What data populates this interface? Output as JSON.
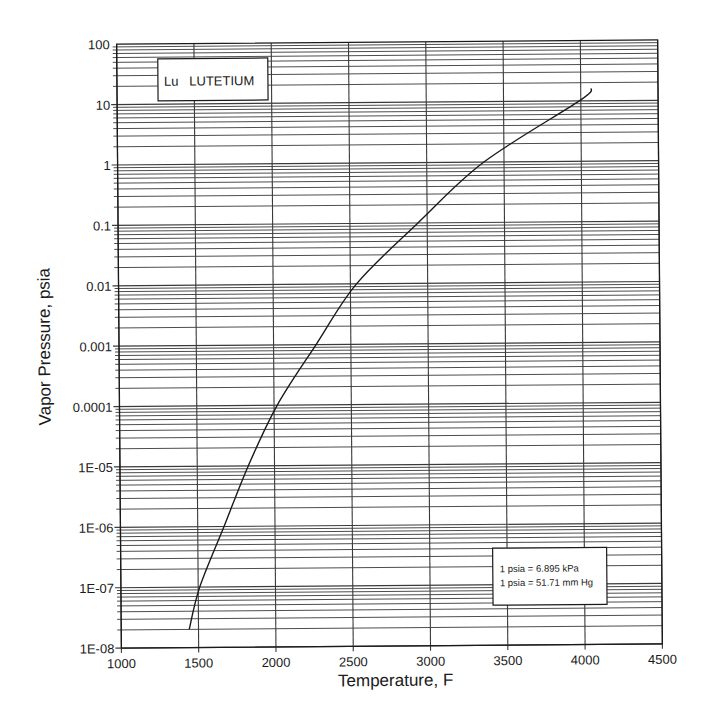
{
  "chart_data": {
    "type": "line",
    "title": "Lu LUTETIUM",
    "xlabel": "Temperature, F",
    "ylabel": "Vapor Pressure, psia",
    "xlim": [
      1000,
      4500
    ],
    "ylim": [
      1e-08,
      100
    ],
    "yscale": "log",
    "grid": true,
    "x_ticks": [
      1000,
      1500,
      2000,
      2500,
      3000,
      3500,
      4000,
      4500
    ],
    "x_tick_labels": [
      "1000",
      "1500",
      "2000",
      "2500",
      "3000",
      "3500",
      "4000",
      "4500"
    ],
    "y_ticks": [
      1e-08,
      1e-07,
      1e-06,
      1e-05,
      0.0001,
      0.001,
      0.01,
      0.1,
      1,
      10,
      100
    ],
    "y_tick_labels": [
      "1E-08",
      "1E-07",
      "1E-06",
      "1E-05",
      "0.0001",
      "0.001",
      "0.01",
      "0.1",
      "1",
      "10",
      "100"
    ],
    "series": [
      {
        "name": "Lutetium vapor pressure",
        "x": [
          1440,
          1510,
          1670,
          1830,
          2020,
          2275,
          2540,
          2940,
          3370,
          3990,
          4070
        ],
        "y": [
          2e-08,
          1e-07,
          1e-06,
          1e-05,
          0.0001,
          0.001,
          0.01,
          0.1,
          1,
          10,
          16
        ]
      }
    ],
    "annotations": [
      {
        "text": "Lu   LUTETIUM",
        "position": "top-left box"
      },
      {
        "text": "1 psia = 6.895 kPa",
        "position": "bottom-right box"
      },
      {
        "text": "1 psia = 51.71 mm Hg",
        "position": "bottom-right box"
      }
    ]
  },
  "legend_box": {
    "label": "Lu   LUTETIUM"
  },
  "conversion_box": {
    "line1": "1 psia = 6.895 kPa",
    "line2": "1 psia = 51.71 mm Hg"
  },
  "axes": {
    "x_title": "Temperature, F",
    "y_title": "Vapor Pressure, psia"
  },
  "colors": {
    "line": "#1a1a1a",
    "grid": "#3a3a3a",
    "background": "#ffffff"
  }
}
